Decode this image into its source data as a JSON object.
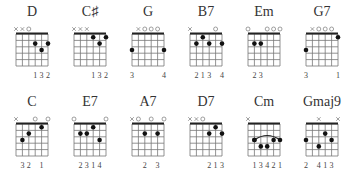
{
  "chart_data": {
    "type": "chord-diagrams",
    "strings": 6,
    "frets_shown": 5,
    "chords": [
      {
        "name": "D",
        "markers": [
          "x",
          "x",
          "o",
          "",
          "",
          ""
        ],
        "dots": [
          [
            3,
            2
          ],
          [
            4,
            3
          ],
          [
            5,
            2
          ]
        ],
        "fingers": [
          "",
          "",
          "",
          "1",
          "3",
          "2"
        ]
      },
      {
        "name": "C♯",
        "markers": [
          "x",
          "x",
          "x",
          "",
          "",
          ""
        ],
        "dots": [
          [
            3,
            1
          ],
          [
            4,
            2
          ],
          [
            5,
            1
          ]
        ],
        "fingers": [
          "",
          "",
          "",
          "1",
          "3",
          "2"
        ]
      },
      {
        "name": "G",
        "markers": [
          "",
          "x",
          "o",
          "o",
          "o",
          ""
        ],
        "dots": [
          [
            0,
            3
          ],
          [
            5,
            3
          ]
        ],
        "fingers": [
          "3",
          "",
          "",
          "",
          "",
          "4"
        ]
      },
      {
        "name": "B7",
        "markers": [
          "x",
          "",
          "",
          "",
          "o",
          ""
        ],
        "dots": [
          [
            1,
            2
          ],
          [
            2,
            1
          ],
          [
            3,
            2
          ],
          [
            5,
            2
          ]
        ],
        "fingers": [
          "",
          "2",
          "1",
          "3",
          "",
          "4"
        ]
      },
      {
        "name": "Em",
        "markers": [
          "o",
          "",
          "",
          "o",
          "o",
          "o"
        ],
        "dots": [
          [
            1,
            2
          ],
          [
            2,
            2
          ]
        ],
        "fingers": [
          "",
          "2",
          "3",
          "",
          "",
          ""
        ]
      },
      {
        "name": "G7",
        "markers": [
          "",
          "x",
          "o",
          "o",
          "o",
          ""
        ],
        "dots": [
          [
            0,
            3
          ],
          [
            5,
            1
          ]
        ],
        "fingers": [
          "3",
          "",
          "",
          "",
          "",
          "1"
        ]
      },
      {
        "name": "C",
        "markers": [
          "x",
          "",
          "",
          "o",
          "",
          "o"
        ],
        "dots": [
          [
            1,
            3
          ],
          [
            2,
            2
          ],
          [
            4,
            1
          ]
        ],
        "fingers": [
          "",
          "3",
          "2",
          "",
          "1",
          ""
        ]
      },
      {
        "name": "E7",
        "markers": [
          "o",
          "",
          "",
          "",
          "",
          "o"
        ],
        "dots": [
          [
            1,
            2
          ],
          [
            2,
            2
          ],
          [
            3,
            1
          ],
          [
            4,
            3
          ]
        ],
        "fingers": [
          "",
          "2",
          "3",
          "1",
          "4",
          ""
        ]
      },
      {
        "name": "A7",
        "markers": [
          "x",
          "o",
          "",
          "o",
          "",
          "o"
        ],
        "dots": [
          [
            2,
            2
          ],
          [
            4,
            2
          ]
        ],
        "fingers": [
          "",
          "",
          "2",
          "",
          "3",
          ""
        ]
      },
      {
        "name": "D7",
        "markers": [
          "x",
          "x",
          "o",
          "",
          "",
          ""
        ],
        "dots": [
          [
            3,
            2
          ],
          [
            4,
            1
          ],
          [
            5,
            2
          ]
        ],
        "fingers": [
          "",
          "",
          "",
          "2",
          "1",
          "3"
        ]
      },
      {
        "name": "Cm",
        "markers": [
          "x",
          "",
          "",
          "",
          "",
          ""
        ],
        "dots": [
          [
            1,
            3
          ],
          [
            2,
            4
          ],
          [
            3,
            4
          ],
          [
            4,
            3
          ]
        ],
        "barre": {
          "fret": 3,
          "from": 1,
          "to": 5
        },
        "fingers": [
          "",
          "1",
          "3",
          "4",
          "2",
          "1"
        ]
      },
      {
        "name": "Gmaj9",
        "markers": [
          "",
          "",
          "x",
          "",
          "",
          "x"
        ],
        "dots": [
          [
            0,
            3
          ],
          [
            2,
            4
          ],
          [
            3,
            2
          ],
          [
            4,
            3
          ]
        ],
        "fingers": [
          "2",
          "",
          "4",
          "1",
          "3",
          ""
        ]
      }
    ]
  }
}
